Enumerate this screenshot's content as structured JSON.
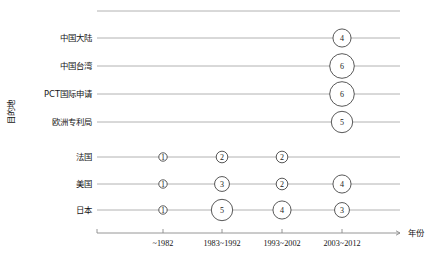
{
  "chart_data": {
    "type": "scatter",
    "title": "",
    "xlabel": "年份",
    "ylabel": "目的地",
    "grid": true,
    "legend": "none",
    "categories": [
      "~1982",
      "1983~1992",
      "1993~2002",
      "2003~2012"
    ],
    "y_categories": [
      "中国大陆",
      "中国台湾",
      "PCT国际申请",
      "欧洲专利局",
      "法国",
      "美国",
      "日本"
    ],
    "points": [
      {
        "y": "中国大陆",
        "x": "2003~2012",
        "value": 4
      },
      {
        "y": "中国台湾",
        "x": "2003~2012",
        "value": 6
      },
      {
        "y": "PCT国际申请",
        "x": "2003~2012",
        "value": 6
      },
      {
        "y": "欧洲专利局",
        "x": "2003~2012",
        "value": 5
      },
      {
        "y": "法国",
        "x": "~1982",
        "value": 1
      },
      {
        "y": "法国",
        "x": "1983~1992",
        "value": 2
      },
      {
        "y": "法国",
        "x": "1993~2002",
        "value": 2
      },
      {
        "y": "美国",
        "x": "~1982",
        "value": 1
      },
      {
        "y": "美国",
        "x": "1983~1992",
        "value": 3
      },
      {
        "y": "美国",
        "x": "1993~2002",
        "value": 2
      },
      {
        "y": "美国",
        "x": "2003~2012",
        "value": 4
      },
      {
        "y": "日本",
        "x": "~1982",
        "value": 1
      },
      {
        "y": "日本",
        "x": "1983~1992",
        "value": 5
      },
      {
        "y": "日本",
        "x": "1993~2002",
        "value": 4
      },
      {
        "y": "日本",
        "x": "2003~2012",
        "value": 3
      }
    ],
    "colors": {
      "bubble_stroke": "#3a3a3a",
      "bubble_fill": "#ffffff",
      "gridline": "#a9a9a9",
      "axis": "#8a8a8a",
      "text": "#141414"
    }
  }
}
